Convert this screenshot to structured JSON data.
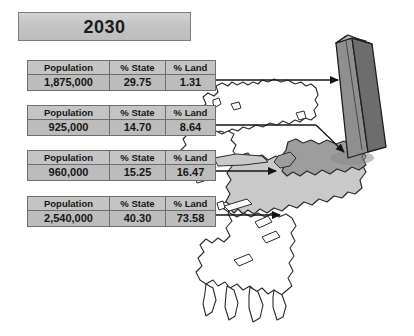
{
  "title": {
    "year": "2030"
  },
  "table_columns": [
    "Population",
    "% State",
    "% Land"
  ],
  "tables": [
    {
      "population": "1,875,000",
      "pct_state": "29.75",
      "pct_land": "1.31"
    },
    {
      "population": "925,000",
      "pct_state": "14.70",
      "pct_land": "8.64"
    },
    {
      "population": "960,000",
      "pct_state": "15.25",
      "pct_land": "16.47"
    },
    {
      "population": "2,540,000",
      "pct_state": "40.30",
      "pct_land": "73.58"
    }
  ],
  "colors": {
    "table_header_fill": "#c4c4c4",
    "table_value_fill": "#bcbcbc",
    "table_border": "#6e6e6e",
    "title_fill": "#c6c6c6",
    "map_outline": "#2b2b2b",
    "map_region_light": "#c9c9c9",
    "map_region_dark": "#9d9d9d",
    "bar_front": "#8f8f8f",
    "bar_side": "#6d6d6d",
    "bar_top": "#b4b4b4",
    "connector_line": "#1a1a1a"
  },
  "map": {
    "name": "region-map",
    "bar_name": "population-bar-3d",
    "connectors": 4
  }
}
